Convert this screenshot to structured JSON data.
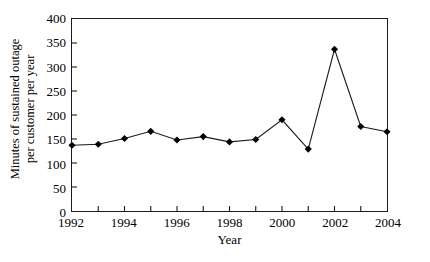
{
  "chart_data": {
    "type": "line",
    "title": "",
    "xlabel": "Year",
    "ylabel_line1": "Minutes of sustained outage",
    "ylabel_line2": "per customer per year",
    "x": [
      1992,
      1993,
      1994,
      1995,
      1996,
      1997,
      1998,
      1999,
      2000,
      2001,
      2002,
      2003,
      2004
    ],
    "values": [
      137,
      139,
      151,
      166,
      148,
      155,
      144,
      149,
      190,
      129,
      337,
      176,
      165
    ],
    "series": [
      {
        "name": "Minutes of sustained outage per customer per year",
        "values": [
          137,
          139,
          151,
          166,
          148,
          155,
          144,
          149,
          190,
          129,
          337,
          176,
          165
        ]
      }
    ],
    "xlim": [
      1992,
      2004
    ],
    "ylim": [
      0,
      400
    ],
    "yticks": [
      0,
      50,
      100,
      150,
      200,
      250,
      300,
      350,
      400
    ],
    "ytick_labels": [
      "0",
      "50",
      "100",
      "150",
      "200",
      "250",
      "300",
      "350",
      "400"
    ],
    "xticks": [
      1992,
      1993,
      1994,
      1995,
      1996,
      1997,
      1998,
      1999,
      2000,
      2001,
      2002,
      2003,
      2004
    ],
    "xtick_labels_shown": [
      {
        "value": 1992,
        "label": "1992"
      },
      {
        "value": 1994,
        "label": "1994"
      },
      {
        "value": 1996,
        "label": "1996"
      },
      {
        "value": 1998,
        "label": "1998"
      },
      {
        "value": 2000,
        "label": "2000"
      },
      {
        "value": 2002,
        "label": "2002"
      },
      {
        "value": 2004,
        "label": "2004"
      }
    ],
    "grid": false,
    "legend": null,
    "marker": "diamond",
    "marker_color": "#000000",
    "line_color": "#1a1a1a",
    "axis_color": "#1a1a1a",
    "background": "#ffffff"
  }
}
